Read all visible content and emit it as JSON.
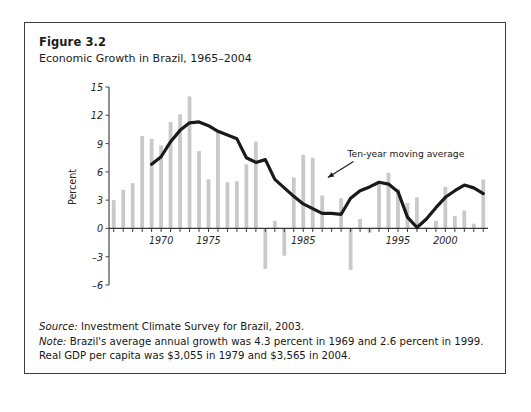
{
  "figure": {
    "number": "Figure 3.2",
    "title": "Economic Growth in Brazil, 1965–2004"
  },
  "notes": {
    "source_label": "Source:",
    "source_text": " Investment Climate Survey for Brazil, 2003.",
    "note_label": "Note:",
    "note_text": " Brazil's average annual growth was 4.3 percent in 1969 and 2.6 percent in 1999. Real GDP per capita was $3,055 in 1979 and $3,565 in 2004."
  },
  "colors": {
    "bar": "#c9c9c9",
    "line": "#1a1a1a",
    "axis": "#555555",
    "frame": "#3c3c3c",
    "text": "#1b1b1b"
  },
  "chart_data": {
    "type": "bar",
    "title": "Economic Growth in Brazil, 1965–2004",
    "xlabel": "",
    "ylabel": "Percent",
    "ylim": [
      -6,
      15
    ],
    "xlim": [
      1964.5,
      2004.5
    ],
    "yticks": [
      15,
      12,
      9,
      6,
      3,
      0,
      -3,
      -6
    ],
    "xticks": [
      1970,
      1975,
      1985,
      1995,
      2000
    ],
    "xticks_all": [
      1965,
      1966,
      1967,
      1968,
      1969,
      1970,
      1971,
      1972,
      1973,
      1974,
      1975,
      1976,
      1977,
      1978,
      1979,
      1980,
      1981,
      1982,
      1983,
      1984,
      1985,
      1986,
      1987,
      1988,
      1989,
      1990,
      1991,
      1992,
      1993,
      1994,
      1995,
      1996,
      1997,
      1998,
      1999,
      2000,
      2001,
      2002,
      2003,
      2004
    ],
    "grid": false,
    "legend": false,
    "annotations": [
      {
        "text": "Ten-year moving average",
        "points_to": "moving-average-line"
      }
    ],
    "categories": [
      1965,
      1966,
      1967,
      1968,
      1969,
      1970,
      1971,
      1972,
      1973,
      1974,
      1975,
      1976,
      1977,
      1978,
      1979,
      1980,
      1981,
      1982,
      1983,
      1984,
      1985,
      1986,
      1987,
      1988,
      1989,
      1990,
      1991,
      1992,
      1993,
      1994,
      1995,
      1996,
      1997,
      1998,
      1999,
      2000,
      2001,
      2002,
      2003,
      2004
    ],
    "series": [
      {
        "name": "Annual GDP growth",
        "type": "bar",
        "values": [
          3.0,
          4.1,
          4.8,
          9.8,
          9.5,
          8.8,
          11.3,
          12.1,
          14.0,
          8.2,
          5.2,
          10.3,
          4.9,
          5.0,
          6.8,
          9.2,
          -4.3,
          0.8,
          -2.9,
          5.4,
          7.8,
          7.5,
          3.5,
          0.1,
          3.2,
          -4.4,
          1.0,
          -0.5,
          4.9,
          5.9,
          4.2,
          2.7,
          3.3,
          0.1,
          0.8,
          4.4,
          1.3,
          1.9,
          0.5,
          5.2
        ]
      },
      {
        "name": "Ten-year moving average",
        "type": "line",
        "x": [
          1969,
          1970,
          1971,
          1972,
          1973,
          1974,
          1975,
          1976,
          1977,
          1978,
          1979,
          1980,
          1981,
          1982,
          1983,
          1984,
          1985,
          1986,
          1987,
          1988,
          1989,
          1990,
          1991,
          1992,
          1993,
          1994,
          1995,
          1996,
          1997,
          1998,
          1999,
          2000,
          2001,
          2002,
          2003,
          2004
        ],
        "values": [
          6.8,
          7.6,
          9.2,
          10.4,
          11.2,
          11.3,
          10.9,
          10.3,
          9.9,
          9.5,
          7.5,
          7.0,
          7.3,
          5.2,
          4.3,
          3.4,
          2.6,
          2.1,
          1.6,
          1.6,
          1.5,
          3.2,
          4.0,
          4.4,
          4.9,
          4.7,
          3.9,
          1.2,
          0.1,
          1.0,
          2.2,
          3.3,
          4.0,
          4.6,
          4.3,
          3.7
        ]
      }
    ]
  }
}
